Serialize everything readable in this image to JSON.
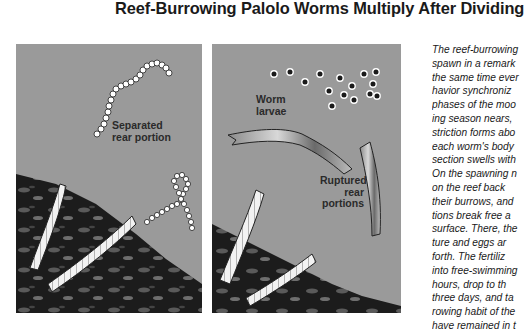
{
  "title": "Reef-Burrowing Palolo Worms Multiply After Dividing",
  "panels": [
    {
      "id": "panel-1",
      "labels": {
        "separated": "Separated\nrear portion"
      },
      "label_lines": [
        "Separated",
        "rear portion"
      ]
    },
    {
      "id": "panel-2",
      "labels": {
        "larvae": "Worm\nlarvae",
        "ruptured": "Ruptured\nrear\nportions"
      },
      "larvae_lines": [
        "Worm",
        "larvae"
      ],
      "ruptured_lines": [
        "Ruptured",
        "rear",
        "portions"
      ]
    }
  ],
  "body_text_lines": [
    "The reef-burrowing",
    "spawn in a remark",
    "the same time ever",
    "havior synchroniz",
    "phases of the moo",
    "ing season nears,",
    "striction forms abo",
    "each worm's body",
    "section swells with",
    "On the spawning n",
    "on the reef back",
    "their burrows, and",
    "tions break free a",
    "surface. There, the",
    "ture and eggs ar",
    "forth. The fertiliz",
    "into free-swimming",
    "hours, drop to th",
    "three days, and ta",
    "rowing habit of the",
    "have remained in t"
  ],
  "colors": {
    "water": "#9a9a9a",
    "reef": "#1c1c1c",
    "worm_body": "#f2f2f2",
    "text": "#1a1a1a"
  }
}
